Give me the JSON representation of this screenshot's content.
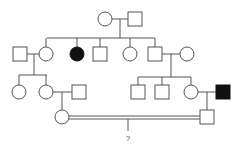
{
  "diagram": {
    "type": "pedigree",
    "colors": {
      "line": "#555555",
      "affected": "#111111",
      "unaffected": "#ffffff"
    },
    "individuals": [
      {
        "id": "I-1",
        "sex": "female",
        "affected": false,
        "x": 105,
        "y": 19
      },
      {
        "id": "I-2",
        "sex": "male",
        "affected": false,
        "x": 135,
        "y": 19
      },
      {
        "id": "II-1",
        "sex": "male",
        "affected": false,
        "x": 20,
        "y": 54
      },
      {
        "id": "II-2",
        "sex": "female",
        "affected": false,
        "x": 46,
        "y": 54
      },
      {
        "id": "II-3",
        "sex": "female",
        "affected": true,
        "x": 77,
        "y": 54
      },
      {
        "id": "II-4",
        "sex": "male",
        "affected": false,
        "x": 100,
        "y": 54
      },
      {
        "id": "II-5",
        "sex": "female",
        "affected": false,
        "x": 130,
        "y": 54
      },
      {
        "id": "II-6",
        "sex": "male",
        "affected": false,
        "x": 155,
        "y": 54
      },
      {
        "id": "II-7",
        "sex": "female",
        "affected": false,
        "x": 187,
        "y": 54
      },
      {
        "id": "III-1",
        "sex": "female",
        "affected": false,
        "x": 19,
        "y": 92
      },
      {
        "id": "III-2",
        "sex": "female",
        "affected": false,
        "x": 46,
        "y": 92
      },
      {
        "id": "III-3",
        "sex": "male",
        "affected": false,
        "x": 79,
        "y": 92
      },
      {
        "id": "III-4",
        "sex": "male",
        "affected": false,
        "x": 138,
        "y": 92
      },
      {
        "id": "III-5",
        "sex": "male",
        "affected": false,
        "x": 162,
        "y": 92
      },
      {
        "id": "III-6",
        "sex": "female",
        "affected": false,
        "x": 191,
        "y": 92
      },
      {
        "id": "III-7",
        "sex": "male",
        "affected": true,
        "x": 223,
        "y": 92
      },
      {
        "id": "IV-1",
        "sex": "female",
        "affected": false,
        "x": 62,
        "y": 117
      },
      {
        "id": "IV-2",
        "sex": "male",
        "affected": false,
        "x": 207,
        "y": 117
      }
    ],
    "unknown_offspring_label": "?"
  }
}
